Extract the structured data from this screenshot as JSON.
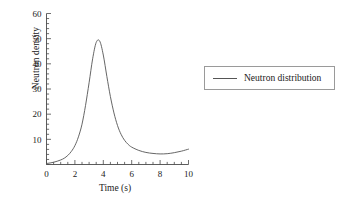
{
  "chart_data": {
    "type": "line",
    "title": "",
    "xlabel": "Time (s)",
    "ylabel": "Neutron density",
    "xlim": [
      0,
      10
    ],
    "ylim": [
      0,
      60
    ],
    "xticks": [
      "0",
      "2",
      "4",
      "6",
      "8",
      "10"
    ],
    "xtick_values": [
      0,
      2,
      4,
      6,
      8,
      10
    ],
    "yticks": [
      "10",
      "20",
      "30",
      "40",
      "50",
      "60"
    ],
    "ytick_values": [
      10,
      20,
      30,
      40,
      50,
      60
    ],
    "x_minor_step": 0.5,
    "y_minor_step": 2,
    "grid": false,
    "legend_position": "right",
    "series": [
      {
        "name": "Neutron distribution",
        "color": "#555555",
        "x": [
          0,
          0.25,
          0.5,
          0.75,
          1,
          1.25,
          1.5,
          1.75,
          2,
          2.25,
          2.5,
          2.75,
          3,
          3.25,
          3.5,
          3.75,
          4,
          4.25,
          4.5,
          4.75,
          5,
          5.25,
          5.5,
          5.75,
          6,
          6.5,
          7,
          7.5,
          8,
          8.5,
          9,
          9.5,
          10
        ],
        "y": [
          0.4,
          0.6,
          0.9,
          1.3,
          1.8,
          2.5,
          3.6,
          5.2,
          7.5,
          11,
          16,
          23.5,
          32.5,
          42,
          48.5,
          49,
          43.5,
          35,
          27,
          20.5,
          15.5,
          12,
          9.6,
          8,
          6.9,
          5.6,
          4.8,
          4.4,
          4.2,
          4.3,
          4.7,
          5.3,
          6.1
        ]
      }
    ]
  },
  "legend": {
    "entries": [
      {
        "label": "Neutron distribution",
        "color": "#555555"
      }
    ]
  },
  "axes": {
    "x_axis_label": "Time (s)",
    "y_axis_label": "Neutron density"
  }
}
